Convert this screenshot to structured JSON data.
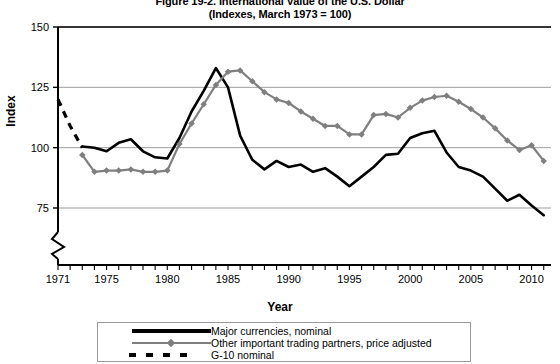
{
  "figure": {
    "title_line1": "Figure 19-2. International Value of the U.S. Dollar",
    "title_line2": "(Indexes, March 1973 = 100)"
  },
  "axes": {
    "x_title": "Year",
    "y_title": "Index"
  },
  "legend": {
    "items": [
      {
        "label": "Major currencies, nominal",
        "key": "solid-black-line",
        "color": "#000000"
      },
      {
        "label": "Other important trading partners, price adjusted",
        "key": "gray-line-with-diamond-markers",
        "color": "#7f7f7f"
      },
      {
        "label": "G-10 nominal",
        "key": "dashed-black-line",
        "color": "#000000"
      }
    ]
  },
  "chart_data": {
    "type": "line",
    "title": "Figure 19-2. International Value of the U.S. Dollar",
    "subtitle": "(Indexes, March 1973 = 100)",
    "xlabel": "Year",
    "ylabel": "Index",
    "xlim": [
      1971,
      2011.6
    ],
    "ylim": [
      68,
      150
    ],
    "yticks": [
      75,
      100,
      125,
      150
    ],
    "ytick_labels": [
      "75",
      "100",
      "125",
      "150"
    ],
    "xticks": [
      1971,
      1975,
      1980,
      1985,
      1990,
      1995,
      2000,
      2005,
      2010
    ],
    "xtick_labels": [
      "1971",
      "1975",
      "1980",
      "1985",
      "1990",
      "1995",
      "2000",
      "2005",
      "2010"
    ],
    "x_minor_tick_interval": 1,
    "grid": "horizontal",
    "y_axis_break": true,
    "legend_position": "below",
    "series": [
      {
        "name": "Major currencies, nominal",
        "style": "solid",
        "color": "#000000",
        "markers": false,
        "x": [
          1973,
          1974,
          1975,
          1976,
          1977,
          1978,
          1979,
          1980,
          1981,
          1982,
          1983,
          1984,
          1985,
          1986,
          1987,
          1988,
          1989,
          1990,
          1991,
          1992,
          1993,
          1994,
          1995,
          1996,
          1997,
          1998,
          1999,
          2000,
          2001,
          2002,
          2003,
          2004,
          2005,
          2006,
          2007,
          2008,
          2009,
          2010,
          2011
        ],
        "y": [
          100.5,
          100.0,
          98.5,
          102.0,
          103.5,
          98.5,
          96.0,
          95.5,
          104.0,
          115.0,
          123.5,
          133.0,
          125.0,
          105.0,
          95.0,
          91.0,
          94.5,
          92.0,
          93.0,
          90.0,
          91.5,
          88.0,
          84.0,
          88.0,
          92.0,
          97.0,
          97.5,
          104.0,
          106.0,
          107.0,
          98.0,
          92.0,
          90.5,
          88.0,
          83.0,
          78.0,
          80.5,
          76.0,
          72.0
        ]
      },
      {
        "name": "Other important trading partners, price adjusted",
        "style": "solid",
        "color": "#7f7f7f",
        "markers": true,
        "x": [
          1973,
          1974,
          1975,
          1976,
          1977,
          1978,
          1979,
          1980,
          1981,
          1982,
          1983,
          1984,
          1985,
          1986,
          1987,
          1988,
          1989,
          1990,
          1991,
          1992,
          1993,
          1994,
          1995,
          1996,
          1997,
          1998,
          1999,
          2000,
          2001,
          2002,
          2003,
          2004,
          2005,
          2006,
          2007,
          2008,
          2009,
          2010,
          2011
        ],
        "y": [
          97.0,
          90.0,
          90.5,
          90.5,
          91.0,
          90.0,
          90.0,
          90.5,
          101.5,
          110.0,
          118.0,
          126.0,
          131.5,
          132.0,
          127.5,
          123.0,
          120.0,
          118.5,
          115.0,
          112.0,
          109.0,
          109.0,
          105.5,
          105.5,
          113.5,
          114.0,
          112.5,
          116.5,
          119.5,
          121.0,
          121.5,
          119.0,
          116.0,
          112.5,
          108.0,
          103.0,
          99.0,
          101.0,
          94.5
        ]
      },
      {
        "name": "G-10 nominal",
        "style": "dashed",
        "color": "#000000",
        "markers": false,
        "x": [
          1971,
          1972,
          1973
        ],
        "y": [
          120.0,
          109.0,
          100.0
        ]
      }
    ]
  }
}
